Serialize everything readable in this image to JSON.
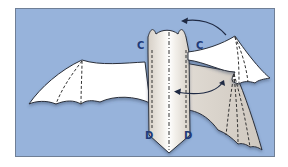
{
  "diagram": {
    "colors": {
      "background": "#ffffff",
      "panel": "#97b3db",
      "panel_border": "#6f7f96",
      "wing_front": "#ffffff",
      "wing_back": "#d9d3cb",
      "outline": "#2a2f3a",
      "fold_line": "#333333",
      "label": "#1f3a78",
      "arrow": "#1f2a44"
    },
    "labels": {
      "c_left": "C",
      "c_right": "C",
      "d_left": "D",
      "d_right": "D"
    },
    "arrows": [
      {
        "name": "top-arrow",
        "direction": "right-to-left curve",
        "description": "curved arrow over body toward left"
      },
      {
        "name": "lower-arrow",
        "direction": "right-to-left curve",
        "description": "curved arrow from right wing toward body"
      }
    ],
    "fold_lines": {
      "type": "dashed",
      "left_wing_count": 2,
      "body_count": 3,
      "right_wing_count": 3
    }
  }
}
